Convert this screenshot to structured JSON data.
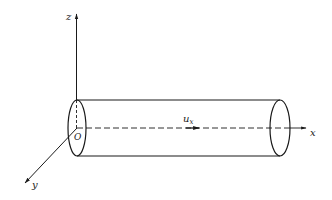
{
  "diagram": {
    "colors": {
      "stroke": "#1a1a1a",
      "background": "#ffffff"
    },
    "axes": {
      "z": {
        "label": "z"
      },
      "x": {
        "label": "x"
      },
      "y": {
        "label": "y"
      },
      "origin": {
        "label": "O"
      }
    },
    "velocity": {
      "symbol": "u",
      "subscript": "x"
    },
    "shapes": {
      "cylinder": {
        "left_end_center": [
          77,
          128
        ],
        "right_end_center": [
          280,
          128
        ],
        "radius_y": 28,
        "radius_x_ellipse": 9
      }
    }
  }
}
